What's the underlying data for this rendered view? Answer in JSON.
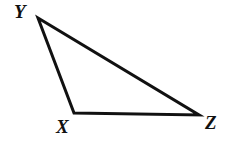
{
  "figure": {
    "name": "triangle-xyz",
    "type": "geometry-diagram",
    "background_color": "#ffffff",
    "stroke_color": "#111111",
    "stroke_width": 3,
    "canvas": {
      "width": 235,
      "height": 144
    },
    "vertices": [
      {
        "id": "Y",
        "label": "Y",
        "x": 38,
        "y": 18,
        "label_x": 14,
        "label_y": 2
      },
      {
        "id": "X",
        "label": "X",
        "x": 74,
        "y": 113,
        "label_x": 56,
        "label_y": 117
      },
      {
        "id": "Z",
        "label": "Z",
        "x": 199,
        "y": 115,
        "label_x": 205,
        "label_y": 113
      }
    ],
    "edges": [
      {
        "id": "YX",
        "from": "Y",
        "to": "X"
      },
      {
        "id": "XZ",
        "from": "X",
        "to": "Z"
      },
      {
        "id": "ZY",
        "from": "Z",
        "to": "Y"
      }
    ],
    "polygon_points": "38,18 74,113 199,115"
  }
}
